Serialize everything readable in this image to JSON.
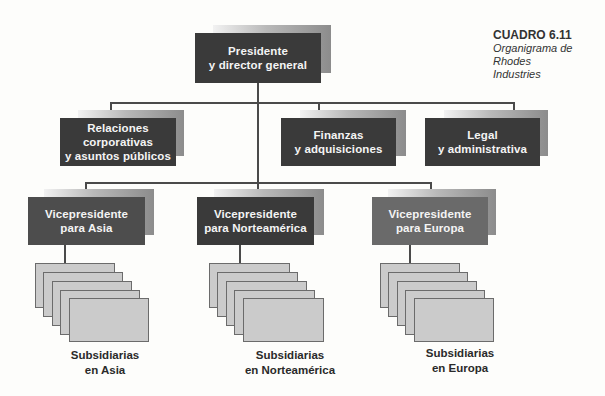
{
  "caption": {
    "number": "CUADRO 6.11",
    "title_line1": "Organigrama de Rhodes",
    "title_line2": "Industries"
  },
  "org_chart": {
    "top": {
      "line1": "Presidente",
      "line2": "y director general"
    },
    "staff": [
      {
        "line1": "Relaciones",
        "line2": "corporativas",
        "line3": "y asuntos públicos"
      },
      {
        "line1": "Finanzas",
        "line2": "y adquisiciones"
      },
      {
        "line1": "Legal",
        "line2": "y administrativa"
      }
    ],
    "vice_presidents": [
      {
        "line1": "Vicepresidente",
        "line2": "para Asia"
      },
      {
        "line1": "Vicepresidente",
        "line2": "para Norteamérica"
      },
      {
        "line1": "Vicepresidente",
        "line2": "para Europa"
      }
    ],
    "subsidiaries": [
      {
        "line1": "Subsidiarias",
        "line2": "en Asia"
      },
      {
        "line1": "Subsidiarias",
        "line2": "en Norteamérica"
      },
      {
        "line1": "Subsidiarias",
        "line2": "en Europa"
      }
    ]
  },
  "colors": {
    "dark_box": "#3a3a3a",
    "europe_box": "#6a6a6a",
    "subsidiary_card": "#cbcbcb",
    "connector": "#4a4a4a"
  }
}
